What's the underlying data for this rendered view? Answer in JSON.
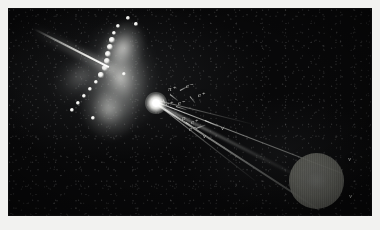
{
  "figure": {
    "kind": "bubble-chamber-event-photograph",
    "background_color": "#f2f2f0",
    "plate_color": "#080809",
    "track_color": "#e8e8e4",
    "label_color": "#c9cac6",
    "disc_color": "#65665f"
  },
  "features": {
    "incoming_beam": "beam-track",
    "vertex": "interaction-vertex",
    "shower": "luminous-shower-fan",
    "disc": "grey-disc"
  },
  "particle_labels": [
    {
      "id": "lbl-pi-plus",
      "text": "π⁺",
      "x": 168,
      "y": 86
    },
    {
      "id": "lbl-e-minus-1",
      "text": "e⁻",
      "x": 186,
      "y": 83
    },
    {
      "id": "lbl-e-plus-1",
      "text": "e⁺",
      "x": 198,
      "y": 92
    },
    {
      "id": "lbl-e-minus-2",
      "text": "e⁻",
      "x": 178,
      "y": 100
    },
    {
      "id": "lbl-e-plus-2",
      "text": "e⁺",
      "x": 166,
      "y": 101
    },
    {
      "id": "lbl-p",
      "text": "p",
      "x": 182,
      "y": 115
    },
    {
      "id": "lbl-e-plus-3",
      "text": "e⁺",
      "x": 191,
      "y": 119
    },
    {
      "id": "lbl-e-minus-3",
      "text": "e⁻",
      "x": 189,
      "y": 126
    },
    {
      "id": "lbl-nu-1",
      "text": "ν",
      "x": 203,
      "y": 133
    },
    {
      "id": "lbl-nu-2",
      "text": "ν",
      "x": 221,
      "y": 125
    },
    {
      "id": "lbl-nu-3",
      "text": "ν",
      "x": 348,
      "y": 156
    },
    {
      "id": "lbl-nu-4",
      "text": "ν",
      "x": 349,
      "y": 193
    }
  ],
  "beads": [
    {
      "x": 118,
      "y": 26,
      "r": 2.0
    },
    {
      "x": 114,
      "y": 33,
      "r": 2.4
    },
    {
      "x": 112,
      "y": 40,
      "r": 2.8
    },
    {
      "x": 110,
      "y": 47,
      "r": 3.2
    },
    {
      "x": 108,
      "y": 54,
      "r": 3.4
    },
    {
      "x": 107,
      "y": 61,
      "r": 3.2
    },
    {
      "x": 105,
      "y": 68,
      "r": 2.8
    },
    {
      "x": 101,
      "y": 75,
      "r": 2.6
    },
    {
      "x": 96,
      "y": 82,
      "r": 2.4
    },
    {
      "x": 90,
      "y": 89,
      "r": 2.2
    },
    {
      "x": 84,
      "y": 96,
      "r": 2.0
    },
    {
      "x": 78,
      "y": 103,
      "r": 2.4
    },
    {
      "x": 72,
      "y": 110,
      "r": 2.0
    },
    {
      "x": 128,
      "y": 18,
      "r": 1.8
    },
    {
      "x": 136,
      "y": 24,
      "r": 1.6
    },
    {
      "x": 93,
      "y": 118,
      "r": 2.2
    },
    {
      "x": 124,
      "y": 74,
      "r": 2.0
    }
  ],
  "kinks": [
    {
      "x": 170,
      "y": 94,
      "w": 10,
      "a": 38
    },
    {
      "x": 180,
      "y": 90,
      "w": 9,
      "a": -28
    },
    {
      "x": 190,
      "y": 96,
      "w": 8,
      "a": 52
    },
    {
      "x": 176,
      "y": 106,
      "w": 11,
      "a": 18
    },
    {
      "x": 186,
      "y": 122,
      "w": 12,
      "a": 32
    },
    {
      "x": 196,
      "y": 128,
      "w": 10,
      "a": -20
    },
    {
      "x": 205,
      "y": 120,
      "w": 14,
      "a": 24
    },
    {
      "x": 163,
      "y": 99,
      "w": 8,
      "a": 64
    }
  ]
}
